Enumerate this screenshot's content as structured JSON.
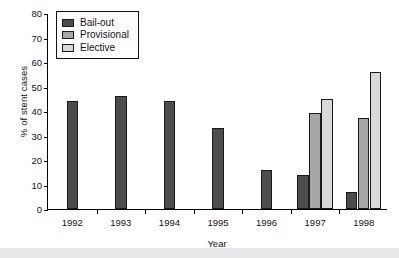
{
  "chart_data": {
    "type": "bar",
    "title": "",
    "xlabel": "Year",
    "ylabel": "% of stent cases",
    "categories": [
      "1992",
      "1993",
      "1994",
      "1995",
      "1996",
      "1997",
      "1998"
    ],
    "series": [
      {
        "name": "Bail-out",
        "color": "#4d4d4d",
        "values": [
          44,
          46,
          44,
          33,
          16,
          14,
          7
        ]
      },
      {
        "name": "Provisional",
        "color": "#a6a6a6",
        "values": [
          null,
          null,
          null,
          null,
          null,
          39,
          37
        ]
      },
      {
        "name": "Elective",
        "color": "#d9d9d9",
        "values": [
          null,
          null,
          null,
          null,
          null,
          45,
          56
        ]
      }
    ],
    "ylim": [
      0,
      80
    ],
    "yticks": [
      0,
      10,
      20,
      30,
      40,
      50,
      60,
      70,
      80
    ],
    "grid": false,
    "legend_position": "upper-left-inside"
  },
  "legend": {
    "items": [
      {
        "label": "Bail-out"
      },
      {
        "label": "Provisional"
      },
      {
        "label": "Elective"
      }
    ]
  }
}
